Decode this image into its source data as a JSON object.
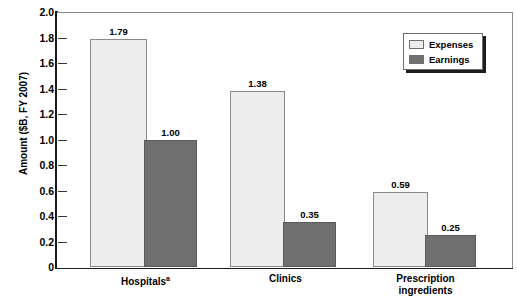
{
  "chart_data": {
    "type": "bar",
    "title": "",
    "xlabel": "",
    "ylabel": "Amount ($B, FY 2007)",
    "ylim": [
      0,
      2.0
    ],
    "ytick_labels": [
      "2.0",
      "1.8",
      "1.6",
      "1.4",
      "1.2",
      "1.0",
      "0.8",
      "0.6",
      "0.4",
      "0.2",
      "0"
    ],
    "ytick_values": [
      2.0,
      1.8,
      1.6,
      1.4,
      1.2,
      1.0,
      0.8,
      0.6,
      0.4,
      0.2,
      0
    ],
    "grid": false,
    "legend_position": "top-right",
    "categories": [
      "Hospitals",
      "Clinics",
      "Prescription ingredients"
    ],
    "category_labels": [
      {
        "line1": "Hospitals",
        "superscript": "a",
        "line2": ""
      },
      {
        "line1": "Clinics",
        "superscript": "",
        "line2": ""
      },
      {
        "line1": "Prescription",
        "superscript": "",
        "line2": "ingredients"
      }
    ],
    "series": [
      {
        "name": "Expenses",
        "color": "#ededed",
        "values": [
          1.79,
          1.38,
          0.59
        ],
        "value_labels": [
          "1.79",
          "1.38",
          "0.59"
        ]
      },
      {
        "name": "Earnings",
        "color": "#6f6f6f",
        "values": [
          1.0,
          0.35,
          0.25
        ],
        "value_labels": [
          "1.00",
          "0.35",
          "0.25"
        ]
      }
    ]
  },
  "legend": {
    "items": [
      {
        "label": "Expenses",
        "swatch": "expenses"
      },
      {
        "label": "Earnings",
        "swatch": "earnings"
      }
    ]
  }
}
